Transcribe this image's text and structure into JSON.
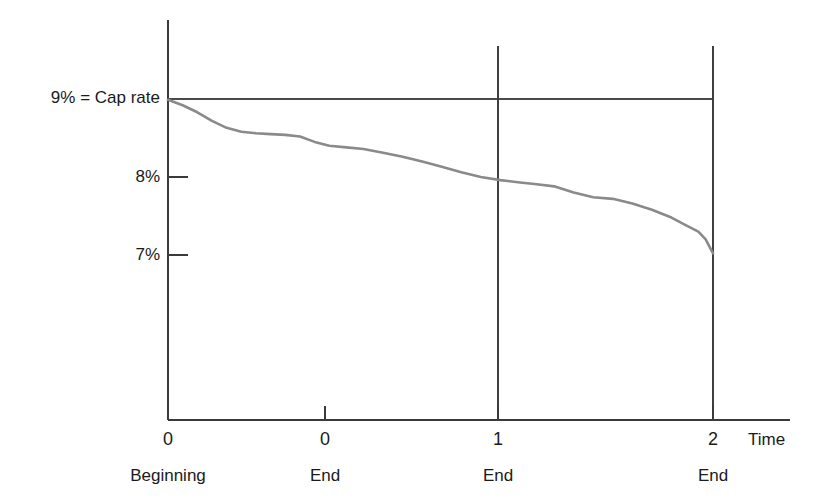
{
  "chart_data": {
    "type": "line",
    "title": "",
    "subtitle": "",
    "xlabel": "Time",
    "ylabel": "",
    "grid": false,
    "legend": false,
    "xlim": [
      0,
      2.35
    ],
    "ylim": [
      6.4,
      9.25
    ],
    "y_axis": {
      "ticks": [
        {
          "value": 9,
          "label": "9% = Cap rate",
          "has_tick_mark": false
        },
        {
          "value": 8,
          "label": "8%",
          "has_tick_mark": true
        },
        {
          "value": 7,
          "label": "7%",
          "has_tick_mark": true
        }
      ]
    },
    "x_axis": {
      "ticks": [
        {
          "value": 0.0,
          "label": "0",
          "sublabel": "Beginning"
        },
        {
          "value": 0.73,
          "label": "0",
          "sublabel": "End"
        },
        {
          "value": 1.5,
          "label": "1",
          "sublabel": "End"
        },
        {
          "value": 2.23,
          "label": "2",
          "sublabel": "End"
        }
      ],
      "axis_name": "Time"
    },
    "reference_lines": [
      {
        "name": "cap-rate-line",
        "orientation": "horizontal",
        "value": 9,
        "label": "9% = Cap rate",
        "x_start": 0.0,
        "x_end": 2.23
      },
      {
        "name": "period-1-divider",
        "orientation": "vertical",
        "value": 1.5
      },
      {
        "name": "period-2-divider",
        "orientation": "vertical",
        "value": 2.23
      }
    ],
    "series": [
      {
        "name": "Declining yield",
        "color": "#8a8a8a",
        "x": [
          0.0,
          0.06,
          0.12,
          0.18,
          0.24,
          0.3,
          0.36,
          0.42,
          0.48,
          0.54,
          0.6,
          0.66,
          0.73,
          0.8,
          0.88,
          0.96,
          1.04,
          1.12,
          1.2,
          1.28,
          1.36,
          1.44,
          1.5,
          1.58,
          1.66,
          1.74,
          1.82,
          1.9,
          1.98,
          2.06,
          2.12,
          2.17,
          2.2,
          2.23
        ],
        "y": [
          8.99,
          8.92,
          8.83,
          8.72,
          8.63,
          8.58,
          8.56,
          8.55,
          8.54,
          8.52,
          8.45,
          8.4,
          8.38,
          8.36,
          8.31,
          8.26,
          8.2,
          8.13,
          8.06,
          8.0,
          7.96,
          7.93,
          7.91,
          7.88,
          7.8,
          7.74,
          7.72,
          7.66,
          7.58,
          7.48,
          7.38,
          7.3,
          7.2,
          7.02
        ]
      }
    ],
    "colors": {
      "curve": "#8a8a8a",
      "axis": "#3a3a3a",
      "text": "#1a1a1a",
      "background": "#ffffff"
    }
  }
}
